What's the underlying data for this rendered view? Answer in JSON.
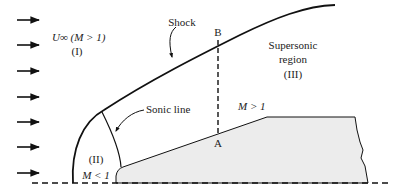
{
  "diagram": {
    "type": "supersonic-flow-over-blunt-body",
    "colors": {
      "stroke": "#111111",
      "body_fill": "#ececec",
      "text": "#222222",
      "background": "#ffffff"
    },
    "labels": {
      "freestream": "U∞ (M > 1)",
      "region_1": "(I)",
      "shock": "Shock",
      "point_b": "B",
      "point_a": "A",
      "supersonic_line1": "Supersonic",
      "supersonic_line2": "region",
      "region_3": "(III)",
      "sonic_line": "Sonic line",
      "mach_gt_1": "M > 1",
      "region_2": "(II)",
      "mach_lt_1": "M < 1"
    },
    "freestream_arrows": {
      "count": 7,
      "y_positions": [
        20,
        45,
        71,
        97,
        122,
        147,
        173
      ]
    }
  }
}
